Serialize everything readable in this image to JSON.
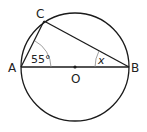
{
  "diagram": {
    "type": "circle-geometry",
    "points": {
      "A": {
        "label": "A",
        "x": 21,
        "y": 67
      },
      "B": {
        "label": "B",
        "x": 129,
        "y": 67
      },
      "C": {
        "label": "C",
        "x": 44,
        "y": 21
      },
      "O": {
        "label": "O",
        "x": 75,
        "y": 67
      }
    },
    "circle": {
      "cx": 75,
      "cy": 67,
      "r": 54
    },
    "angles": {
      "at_A": {
        "label": "55°"
      },
      "at_B": {
        "label": "x"
      }
    },
    "colors": {
      "stroke": "#1a1a1a",
      "arc": "#888888"
    }
  }
}
